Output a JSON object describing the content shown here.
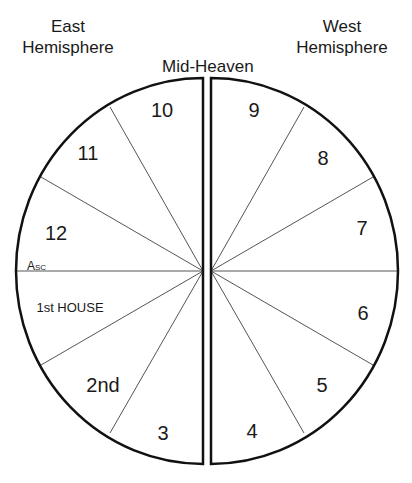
{
  "headers": {
    "east": [
      "East",
      "Hemisphere"
    ],
    "west": [
      "West",
      "Hemisphere"
    ],
    "midheaven": "Mid-Heaven"
  },
  "houses": {
    "h1": "1st HOUSE",
    "h2": "2nd",
    "h3": "3",
    "h4": "4",
    "h5": "5",
    "h6": "6",
    "h7": "7",
    "h8": "8",
    "h9": "9",
    "h10": "10",
    "h11": "11",
    "h12": "12"
  },
  "ascendant": {
    "main": "A",
    "sub": "SC"
  },
  "colors": {
    "outline": "#111111",
    "spoke": "#555555",
    "background": "#ffffff"
  }
}
